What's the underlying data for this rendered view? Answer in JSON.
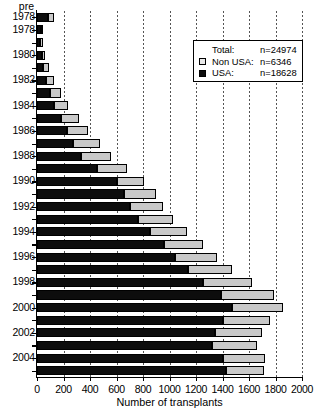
{
  "chart_data": {
    "type": "bar",
    "orientation": "horizontal",
    "stacked": true,
    "title": "",
    "xlabel": "Number of transplants",
    "ylabel": "",
    "xlim": [
      0,
      2000
    ],
    "ylim_categories": 29,
    "grid": "vertical-dotted",
    "xticks": [
      0,
      200,
      400,
      600,
      800,
      1000,
      1200,
      1400,
      1600,
      1800,
      2000
    ],
    "xticklabels": [
      "0",
      "200",
      "400",
      "600",
      "800",
      "1000",
      "1200",
      "1400",
      "1600",
      "1800",
      "2000"
    ],
    "categories": [
      "pre 1978",
      "1978",
      "1979",
      "1980",
      "1981",
      "1982",
      "1983",
      "1984",
      "1985",
      "1986",
      "1987",
      "1988",
      "1989",
      "1990",
      "1991",
      "1992",
      "1993",
      "1994",
      "1995",
      "1996",
      "1997",
      "1998",
      "1999",
      "2000",
      "2001",
      "2002",
      "2003",
      "2004",
      "2005"
    ],
    "visible_yticklabels": [
      "pre",
      "1978",
      "1979",
      "1981",
      "1983",
      "1985",
      "1987",
      "1989",
      "1991",
      "1993",
      "1995",
      "1997",
      "1999",
      "2001",
      "2003",
      "2005"
    ],
    "series": [
      {
        "name": "USA",
        "color": "#0d0d0d",
        "values": [
          80,
          32,
          25,
          38,
          48,
          70,
          95,
          128,
          180,
          228,
          275,
          330,
          455,
          600,
          660,
          700,
          760,
          855,
          955,
          1040,
          1140,
          1255,
          1390,
          1470,
          1400,
          1345,
          1320,
          1400,
          1430
        ]
      },
      {
        "name": "Non USA",
        "color": "#c9c9c9",
        "values": [
          52,
          12,
          18,
          26,
          40,
          62,
          85,
          105,
          135,
          160,
          200,
          230,
          225,
          210,
          235,
          250,
          270,
          280,
          300,
          315,
          335,
          370,
          395,
          390,
          360,
          350,
          340,
          320,
          285
        ]
      }
    ],
    "totals": [
      132,
      44,
      43,
      64,
      88,
      132,
      180,
      233,
      315,
      388,
      475,
      560,
      680,
      810,
      895,
      950,
      1030,
      1135,
      1255,
      1355,
      1475,
      1625,
      1785,
      1860,
      1760,
      1695,
      1660,
      1720,
      1715
    ]
  },
  "legend": {
    "position": "upper-right",
    "rows": [
      {
        "swatch": "none",
        "name": "Total:",
        "value": "n=24974"
      },
      {
        "swatch": "nonusa",
        "name": "Non USA:",
        "value": "n=6346"
      },
      {
        "swatch": "usa",
        "name": "USA:",
        "value": "n=18628"
      }
    ]
  },
  "axis": {
    "pre_label": "pre"
  }
}
